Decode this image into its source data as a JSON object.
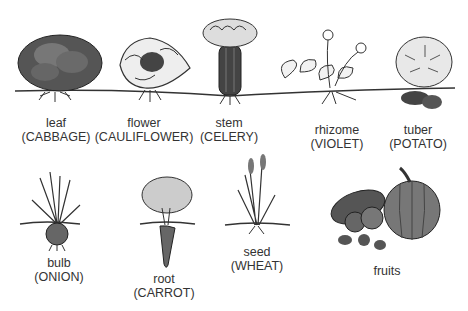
{
  "diagram": {
    "topic": "Edible plant parts",
    "colors": {
      "ink": "#2a2a2a",
      "dark_fill": "#4a4a4a",
      "mid_fill": "#8a8a8a",
      "light_fill": "#d8d8d8",
      "background": "#ffffff"
    },
    "items": [
      {
        "part": "leaf",
        "example": "(CABBAGE)"
      },
      {
        "part": "flower",
        "example": "(CAULIFLOWER)"
      },
      {
        "part": "stem",
        "example": "(CELERY)"
      },
      {
        "part": "rhizome",
        "example": "(VIOLET)"
      },
      {
        "part": "tuber",
        "example": "(POTATO)"
      },
      {
        "part": "bulb",
        "example": "(ONION)"
      },
      {
        "part": "root",
        "example": "(CARROT)"
      },
      {
        "part": "seed",
        "example": "(WHEAT)"
      },
      {
        "part": "fruits",
        "example": ""
      }
    ]
  }
}
